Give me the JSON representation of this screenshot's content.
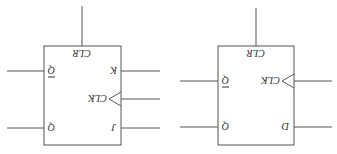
{
  "diagram": {
    "orientation": "rotated 180 degrees",
    "flipflops": [
      {
        "type": "JK flip-flop",
        "labels": {
          "clr": "CLR",
          "k": "K",
          "j": "J",
          "clk": "CLK",
          "q": "Q",
          "qbar": "Q"
        }
      },
      {
        "type": "D flip-flop",
        "labels": {
          "clr": "CLR",
          "d": "D",
          "clk": "CLK",
          "q": "Q",
          "qbar": "Q"
        }
      }
    ],
    "colors": {
      "stroke": "#555555",
      "text": "#333333",
      "background": "#ffffff"
    }
  }
}
